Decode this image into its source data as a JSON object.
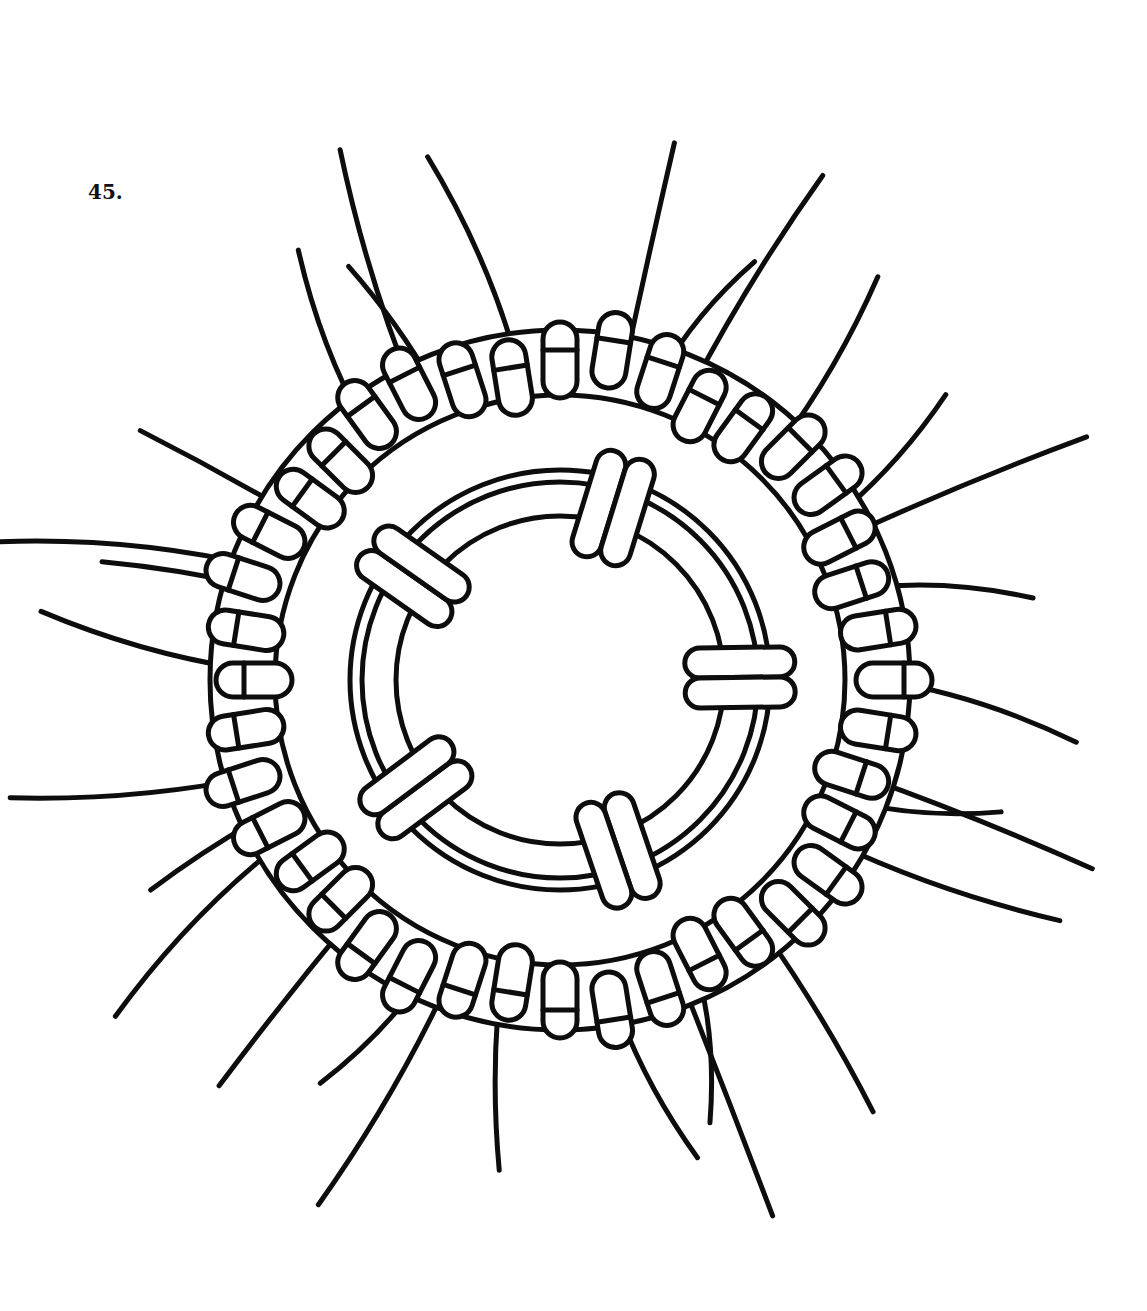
{
  "figure": {
    "label": "45.",
    "colors": {
      "ink": "#0d0d0d",
      "paper": "#ffffff"
    },
    "center": [
      560,
      680
    ],
    "outer_ring": {
      "radius": 330,
      "lobes": 9,
      "knot_count": 40
    },
    "inner_ring": {
      "radius": 170,
      "knot_count": 5
    },
    "radiating_cords": 30
  }
}
